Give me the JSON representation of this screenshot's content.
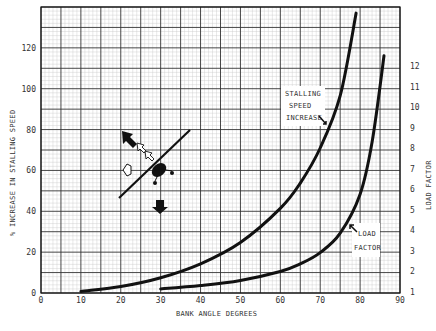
{
  "chart_data": {
    "type": "line",
    "title": "",
    "xlabel": "BANK ANGLE DEGREES",
    "ylabel": "% INCREASE IN STALLING SPEED",
    "y2label": "LOAD FACTOR",
    "xlim": [
      0,
      90
    ],
    "ylim": [
      0,
      140
    ],
    "y2lim": [
      1,
      13
    ],
    "xticks": [
      "0",
      "10",
      "20",
      "30",
      "40",
      "50",
      "60",
      "70",
      "80",
      "90"
    ],
    "yticks": [
      "0",
      "20",
      "40",
      "60",
      "80",
      "100",
      "120"
    ],
    "y2ticks": [
      "1",
      "2",
      "3",
      "4",
      "5",
      "6",
      "7",
      "8",
      "9",
      "10",
      "11",
      "12"
    ],
    "grid": true,
    "series": [
      {
        "name": "STALLING SPEED INCREASE",
        "axis": "left",
        "x": [
          10,
          20,
          30,
          40,
          50,
          60,
          65,
          70,
          75,
          79
        ],
        "values": [
          0.8,
          3.2,
          7.5,
          14.3,
          24.7,
          41.4,
          53.8,
          71.0,
          96.6,
          137
        ]
      },
      {
        "name": "LOAD FACTOR",
        "axis": "right",
        "x": [
          30,
          40,
          50,
          60,
          65,
          70,
          75,
          80,
          83,
          86
        ],
        "values": [
          1.15,
          1.31,
          1.56,
          2.0,
          2.37,
          2.92,
          3.86,
          5.76,
          8.3,
          12.5
        ]
      }
    ],
    "annotations": [
      {
        "text_lines": [
          "STALLING",
          "SPEED",
          "INCREASE"
        ],
        "points_to": "STALLING SPEED INCREASE"
      },
      {
        "text_lines": [
          "LOAD",
          "FACTOR"
        ],
        "points_to": "LOAD FACTOR"
      },
      {
        "text": "airplane-in-bank-illustration",
        "position": "x≈20-30°, y≈40-80%"
      }
    ]
  },
  "labels": {
    "xlabel": "BANK ANGLE DEGREES",
    "ylabel": "% INCREASE IN STALLING SPEED",
    "y2label": "LOAD FACTOR",
    "stall_1": "STALLING",
    "stall_2": "SPEED",
    "stall_3": "INCREASE",
    "load_1": "LOAD",
    "load_2": "FACTOR"
  }
}
